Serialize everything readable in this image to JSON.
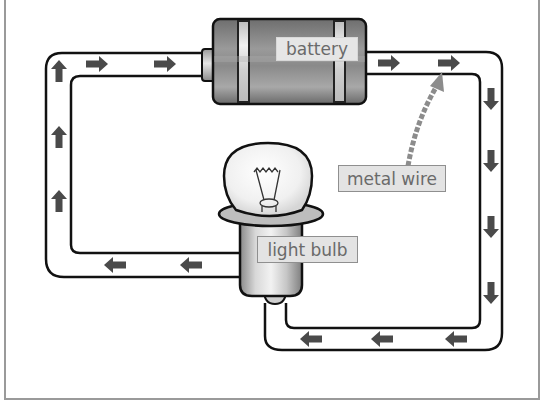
{
  "diagram": {
    "type": "simple electric circuit",
    "labels": {
      "battery": "battery",
      "light_bulb": "light bulb",
      "metal_wire": "metal wire"
    },
    "components": [
      "battery",
      "light bulb",
      "metal wire"
    ],
    "current_direction": "clockwise (from battery right terminal, down right side, left along bottom into bulb, out of bulb left along lower-left wire, up left side, right into battery)",
    "arrows": {
      "top_left_segment": {
        "count": 2,
        "direction": "right"
      },
      "top_right_segment": {
        "count": 2,
        "direction": "right"
      },
      "right_segment": {
        "count": 4,
        "direction": "down"
      },
      "bottom_segment": {
        "count": 4,
        "direction": "left"
      },
      "lower_left_segment": {
        "count": 2,
        "direction": "left"
      },
      "left_segment": {
        "count": 3,
        "direction": "up"
      }
    },
    "colors": {
      "wire_outline": "#111111",
      "arrow": "#4a4a4a",
      "battery_body": "#7d7d7d",
      "label_background": "#e3e3e3",
      "label_text": "#6a6a6a",
      "pointer_arrow": "#8c8c8c",
      "frame": "#9a9a9a"
    }
  }
}
